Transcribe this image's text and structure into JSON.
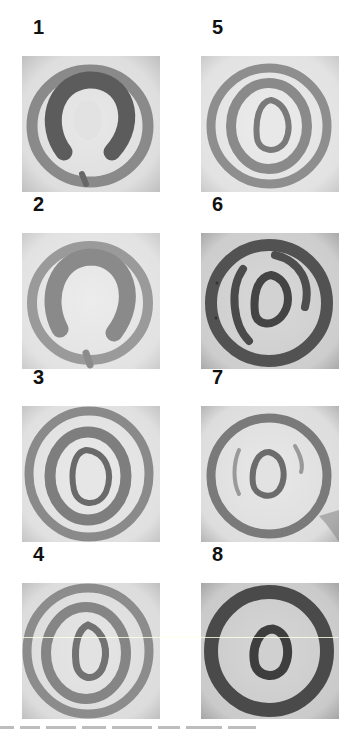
{
  "figure": {
    "layout": {
      "columns": 2,
      "rows": 4
    },
    "panels": [
      {
        "label": "1",
        "pattern": "broken-ring-horseshoe",
        "tone": "medium",
        "description": "outer ring with inner dark horseshoe opening at bottom"
      },
      {
        "label": "2",
        "pattern": "broken-ring-horseshoe",
        "tone": "light",
        "description": "outer ring with lighter inner horseshoe opening at bottom"
      },
      {
        "label": "3",
        "pattern": "concentric-rings",
        "tone": "light",
        "description": "outer ring, middle closed ring, inner pear-shaped core"
      },
      {
        "label": "4",
        "pattern": "concentric-rings",
        "tone": "light",
        "description": "outer ring, middle ring, inner pear-shaped core"
      },
      {
        "label": "5",
        "pattern": "concentric-rings",
        "tone": "light",
        "description": "outer ring, middle ring, inner core"
      },
      {
        "label": "6",
        "pattern": "core-with-arcs",
        "tone": "dark",
        "description": "dark outer ring, two side arcs, dark inner core"
      },
      {
        "label": "7",
        "pattern": "core-with-faint-arcs",
        "tone": "light",
        "description": "outer ring, faint side arcs, inner core"
      },
      {
        "label": "8",
        "pattern": "thick-ring-with-core",
        "tone": "dark",
        "description": "thick dark outer ring and dark inner core"
      }
    ]
  },
  "colors": {
    "background": "#ffffff",
    "label": "#111111",
    "panel_light": "#e4e4e4",
    "panel_dark": "#c9c9c9",
    "ring_light": "#8f8f8f",
    "ring_medium": "#6e6e6e",
    "ring_dark": "#4a4a4a"
  }
}
